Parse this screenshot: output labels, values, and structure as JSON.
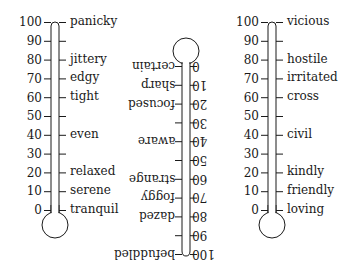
{
  "diagram": {
    "colors": {
      "ink": "#1a1a1a",
      "background": "#ffffff"
    },
    "thermometers": [
      {
        "name": "anxiety",
        "orientation": "upright",
        "scale": [
          "100",
          "90",
          "80",
          "70",
          "60",
          "50",
          "40",
          "30",
          "20",
          "10",
          "0"
        ],
        "labels": [
          {
            "value": 100,
            "text": "panicky"
          },
          {
            "value": 80,
            "text": "jittery"
          },
          {
            "value": 70,
            "text": "edgy"
          },
          {
            "value": 60,
            "text": "tight"
          },
          {
            "value": 40,
            "text": "even"
          },
          {
            "value": 20,
            "text": "relaxed"
          },
          {
            "value": 10,
            "text": "serene"
          },
          {
            "value": 0,
            "text": "tranquil"
          }
        ]
      },
      {
        "name": "clarity",
        "orientation": "upside-down",
        "scale": [
          "0",
          "10",
          "20",
          "30",
          "40",
          "50",
          "60",
          "70",
          "80",
          "90",
          "100"
        ],
        "labels": [
          {
            "value": 0,
            "text": "certain"
          },
          {
            "value": 10,
            "text": "sharp"
          },
          {
            "value": 20,
            "text": "focused"
          },
          {
            "value": 40,
            "text": "aware"
          },
          {
            "value": 60,
            "text": "strange"
          },
          {
            "value": 70,
            "text": "foggy"
          },
          {
            "value": 80,
            "text": "dazed"
          },
          {
            "value": 100,
            "text": "befuddled"
          }
        ]
      },
      {
        "name": "hostility",
        "orientation": "upright",
        "scale": [
          "100",
          "90",
          "80",
          "70",
          "60",
          "50",
          "40",
          "30",
          "20",
          "10",
          "0"
        ],
        "labels": [
          {
            "value": 100,
            "text": "vicious"
          },
          {
            "value": 80,
            "text": "hostile"
          },
          {
            "value": 70,
            "text": "irritated"
          },
          {
            "value": 60,
            "text": "cross"
          },
          {
            "value": 40,
            "text": "civil"
          },
          {
            "value": 20,
            "text": "kindly"
          },
          {
            "value": 10,
            "text": "friendly"
          },
          {
            "value": 0,
            "text": "loving"
          }
        ]
      }
    ]
  }
}
